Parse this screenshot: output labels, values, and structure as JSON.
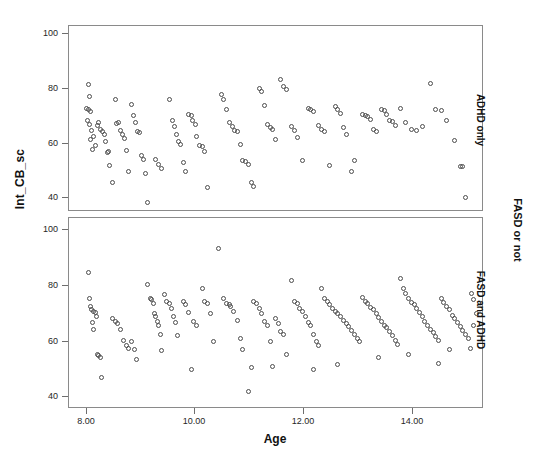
{
  "chart_data": {
    "type": "scatter",
    "title": "",
    "xlabel": "Age",
    "ylabel": "Int_CB_sc",
    "group_label": "FASD or not",
    "xlim": [
      7.6,
      15.2
    ],
    "ylim": [
      30,
      104
    ],
    "xticks": [
      8.0,
      10.0,
      12.0,
      14.0
    ],
    "xticklabels": [
      "8.00",
      "10.00",
      "12.00",
      "14.00"
    ],
    "yticks": [
      40,
      60,
      80,
      100
    ],
    "yticklabels": [
      "40",
      "60",
      "80",
      "100"
    ],
    "grid": false,
    "legend": "none",
    "marker": "open-circle",
    "marker_color": "#4c4c4c",
    "panels": [
      {
        "label": "ADHD only",
        "n": 124,
        "points": [
          [
            7.95,
            80.5
          ],
          [
            7.98,
            75.5
          ],
          [
            7.93,
            71.0
          ],
          [
            7.96,
            70.3
          ],
          [
            7.99,
            69.6
          ],
          [
            7.94,
            66.0
          ],
          [
            7.97,
            64.5
          ],
          [
            8.02,
            62.0
          ],
          [
            8.05,
            59.5
          ],
          [
            8.0,
            58.2
          ],
          [
            8.03,
            54.5
          ],
          [
            8.08,
            56.0
          ],
          [
            8.12,
            63.8
          ],
          [
            8.15,
            65.0
          ],
          [
            8.18,
            62.5
          ],
          [
            8.21,
            61.5
          ],
          [
            8.25,
            60.2
          ],
          [
            8.28,
            57.5
          ],
          [
            8.32,
            53.5
          ],
          [
            8.3,
            53.0
          ],
          [
            8.35,
            48.0
          ],
          [
            8.4,
            41.0
          ],
          [
            8.45,
            74.5
          ],
          [
            8.48,
            64.8
          ],
          [
            8.52,
            65.0
          ],
          [
            8.55,
            62.0
          ],
          [
            8.58,
            60.5
          ],
          [
            8.62,
            58.8
          ],
          [
            8.66,
            54.0
          ],
          [
            8.7,
            45.5
          ],
          [
            8.75,
            72.5
          ],
          [
            8.78,
            68.0
          ],
          [
            8.82,
            65.0
          ],
          [
            8.86,
            61.5
          ],
          [
            8.9,
            61.0
          ],
          [
            8.94,
            52.0
          ],
          [
            8.97,
            50.5
          ],
          [
            9.0,
            44.5
          ],
          [
            9.05,
            33.0
          ],
          [
            9.2,
            50.5
          ],
          [
            9.25,
            48.5
          ],
          [
            9.3,
            46.5
          ],
          [
            9.45,
            74.5
          ],
          [
            9.5,
            66.0
          ],
          [
            9.55,
            63.5
          ],
          [
            9.58,
            60.5
          ],
          [
            9.62,
            57.5
          ],
          [
            9.66,
            56.5
          ],
          [
            9.7,
            49.0
          ],
          [
            9.74,
            45.5
          ],
          [
            9.8,
            68.5
          ],
          [
            9.85,
            68.0
          ],
          [
            9.88,
            66.0
          ],
          [
            9.92,
            64.5
          ],
          [
            9.95,
            59.5
          ],
          [
            10.0,
            56.0
          ],
          [
            10.05,
            55.5
          ],
          [
            10.1,
            53.5
          ],
          [
            10.15,
            39.0
          ],
          [
            10.4,
            76.5
          ],
          [
            10.45,
            74.5
          ],
          [
            10.5,
            70.5
          ],
          [
            10.55,
            65.0
          ],
          [
            10.6,
            63.5
          ],
          [
            10.65,
            62.0
          ],
          [
            10.7,
            61.5
          ],
          [
            10.75,
            56.5
          ],
          [
            10.8,
            50.0
          ],
          [
            10.85,
            49.5
          ],
          [
            10.9,
            48.5
          ],
          [
            10.95,
            41.0
          ],
          [
            11.0,
            39.5
          ],
          [
            11.1,
            79.0
          ],
          [
            11.15,
            77.5
          ],
          [
            11.2,
            72.0
          ],
          [
            11.25,
            64.5
          ],
          [
            11.3,
            63.0
          ],
          [
            11.35,
            62.5
          ],
          [
            11.4,
            58.5
          ],
          [
            11.5,
            82.5
          ],
          [
            11.55,
            79.5
          ],
          [
            11.6,
            78.5
          ],
          [
            11.7,
            63.5
          ],
          [
            11.75,
            62.0
          ],
          [
            11.8,
            59.0
          ],
          [
            11.9,
            50.0
          ],
          [
            12.0,
            71.0
          ],
          [
            12.05,
            70.5
          ],
          [
            12.1,
            69.5
          ],
          [
            12.2,
            64.0
          ],
          [
            12.25,
            62.5
          ],
          [
            12.3,
            61.5
          ],
          [
            12.4,
            48.0
          ],
          [
            12.5,
            71.5
          ],
          [
            12.55,
            70.5
          ],
          [
            12.6,
            69.0
          ],
          [
            12.65,
            63.0
          ],
          [
            12.7,
            60.5
          ],
          [
            12.8,
            45.5
          ],
          [
            12.85,
            50.0
          ],
          [
            13.0,
            68.5
          ],
          [
            13.05,
            68.0
          ],
          [
            13.1,
            67.5
          ],
          [
            13.15,
            66.5
          ],
          [
            13.2,
            62.5
          ],
          [
            13.25,
            61.5
          ],
          [
            13.35,
            70.5
          ],
          [
            13.4,
            70.0
          ],
          [
            13.45,
            68.5
          ],
          [
            13.5,
            66.0
          ],
          [
            13.55,
            65.5
          ],
          [
            13.6,
            64.0
          ],
          [
            13.7,
            71.0
          ],
          [
            13.8,
            65.0
          ],
          [
            13.9,
            62.5
          ],
          [
            14.0,
            62.0
          ],
          [
            14.1,
            63.5
          ],
          [
            14.25,
            81.0
          ],
          [
            14.35,
            70.5
          ],
          [
            14.45,
            70.0
          ],
          [
            14.55,
            66.0
          ],
          [
            14.7,
            58.0
          ],
          [
            14.8,
            47.5
          ],
          [
            14.85,
            47.3
          ],
          [
            14.9,
            35.0
          ]
        ]
      },
      {
        "label": "FASD and ADHD",
        "n": 150,
        "points": [
          [
            7.95,
            82.5
          ],
          [
            7.98,
            72.5
          ],
          [
            8.0,
            69.5
          ],
          [
            8.02,
            68.0
          ],
          [
            8.05,
            67.5
          ],
          [
            8.08,
            67.0
          ],
          [
            8.1,
            65.5
          ],
          [
            8.04,
            63.0
          ],
          [
            8.06,
            60.5
          ],
          [
            8.12,
            50.5
          ],
          [
            8.15,
            50.0
          ],
          [
            8.18,
            49.5
          ],
          [
            8.2,
            41.5
          ],
          [
            8.4,
            64.5
          ],
          [
            8.45,
            63.5
          ],
          [
            8.5,
            62.5
          ],
          [
            8.55,
            60.5
          ],
          [
            8.6,
            56.0
          ],
          [
            8.65,
            54.0
          ],
          [
            8.7,
            53.0
          ],
          [
            8.75,
            55.5
          ],
          [
            8.8,
            52.5
          ],
          [
            9.05,
            78.0
          ],
          [
            9.1,
            72.5
          ],
          [
            9.12,
            72.0
          ],
          [
            9.15,
            70.5
          ],
          [
            9.18,
            66.5
          ],
          [
            9.2,
            65.5
          ],
          [
            9.22,
            63.5
          ],
          [
            9.25,
            62.0
          ],
          [
            9.28,
            58.5
          ],
          [
            9.35,
            74.0
          ],
          [
            9.4,
            71.5
          ],
          [
            9.45,
            70.5
          ],
          [
            9.48,
            68.5
          ],
          [
            9.52,
            65.5
          ],
          [
            9.56,
            63.0
          ],
          [
            9.6,
            58.0
          ],
          [
            9.7,
            71.5
          ],
          [
            9.75,
            70.0
          ],
          [
            9.8,
            67.0
          ],
          [
            9.9,
            63.5
          ],
          [
            9.95,
            62.0
          ],
          [
            10.05,
            76.5
          ],
          [
            10.1,
            71.5
          ],
          [
            10.15,
            70.5
          ],
          [
            10.2,
            66.5
          ],
          [
            10.25,
            55.5
          ],
          [
            10.35,
            92.0
          ],
          [
            10.45,
            72.5
          ],
          [
            10.5,
            70.5
          ],
          [
            10.55,
            70.0
          ],
          [
            10.58,
            69.5
          ],
          [
            10.62,
            67.5
          ],
          [
            10.7,
            64.0
          ],
          [
            10.75,
            57.0
          ],
          [
            10.8,
            52.5
          ],
          [
            10.9,
            36.0
          ],
          [
            11.0,
            71.5
          ],
          [
            11.05,
            70.5
          ],
          [
            11.1,
            68.5
          ],
          [
            11.15,
            66.5
          ],
          [
            11.2,
            63.5
          ],
          [
            11.25,
            62.0
          ],
          [
            11.3,
            55.5
          ],
          [
            11.4,
            64.5
          ],
          [
            11.45,
            62.5
          ],
          [
            11.5,
            59.5
          ],
          [
            11.55,
            58.5
          ],
          [
            11.6,
            50.5
          ],
          [
            11.7,
            79.5
          ],
          [
            11.75,
            71.5
          ],
          [
            11.8,
            70.5
          ],
          [
            11.85,
            68.5
          ],
          [
            11.9,
            67.5
          ],
          [
            11.95,
            65.5
          ],
          [
            12.0,
            63.0
          ],
          [
            12.05,
            62.0
          ],
          [
            12.1,
            58.5
          ],
          [
            12.15,
            55.5
          ],
          [
            12.2,
            54.0
          ],
          [
            12.25,
            76.5
          ],
          [
            12.3,
            72.5
          ],
          [
            12.35,
            71.5
          ],
          [
            12.4,
            70.0
          ],
          [
            12.45,
            68.5
          ],
          [
            12.5,
            67.5
          ],
          [
            12.55,
            66.5
          ],
          [
            12.6,
            65.5
          ],
          [
            12.65,
            64.0
          ],
          [
            12.7,
            62.5
          ],
          [
            12.75,
            61.5
          ],
          [
            12.8,
            60.0
          ],
          [
            12.85,
            58.5
          ],
          [
            12.9,
            57.0
          ],
          [
            12.95,
            55.5
          ],
          [
            13.0,
            73.0
          ],
          [
            13.05,
            71.5
          ],
          [
            13.1,
            70.5
          ],
          [
            13.15,
            69.0
          ],
          [
            13.2,
            68.0
          ],
          [
            13.25,
            66.5
          ],
          [
            13.3,
            65.0
          ],
          [
            13.35,
            63.5
          ],
          [
            13.4,
            62.0
          ],
          [
            13.45,
            61.0
          ],
          [
            13.5,
            59.5
          ],
          [
            13.55,
            58.0
          ],
          [
            13.6,
            56.0
          ],
          [
            13.65,
            54.5
          ],
          [
            13.7,
            80.5
          ],
          [
            13.75,
            76.5
          ],
          [
            13.8,
            74.5
          ],
          [
            13.85,
            72.5
          ],
          [
            13.9,
            71.0
          ],
          [
            13.95,
            70.0
          ],
          [
            14.0,
            68.5
          ],
          [
            14.05,
            67.0
          ],
          [
            14.1,
            65.5
          ],
          [
            14.15,
            63.5
          ],
          [
            14.2,
            62.0
          ],
          [
            14.25,
            60.5
          ],
          [
            14.3,
            59.0
          ],
          [
            14.35,
            57.5
          ],
          [
            14.4,
            56.0
          ],
          [
            14.45,
            72.5
          ],
          [
            14.5,
            71.0
          ],
          [
            14.55,
            69.5
          ],
          [
            14.6,
            68.0
          ],
          [
            14.65,
            66.0
          ],
          [
            14.7,
            64.5
          ],
          [
            14.75,
            63.0
          ],
          [
            14.8,
            61.5
          ],
          [
            14.85,
            60.0
          ],
          [
            14.9,
            58.5
          ],
          [
            14.95,
            57.0
          ],
          [
            15.0,
            74.5
          ],
          [
            15.05,
            72.0
          ],
          [
            15.1,
            66.5
          ],
          [
            15.05,
            62.0
          ],
          [
            14.98,
            53.0
          ],
          [
            14.6,
            52.5
          ],
          [
            14.4,
            47.0
          ],
          [
            12.55,
            46.5
          ],
          [
            12.1,
            44.5
          ],
          [
            11.35,
            46.0
          ],
          [
            10.95,
            45.5
          ],
          [
            9.85,
            44.5
          ],
          [
            9.3,
            52.0
          ],
          [
            8.85,
            48.5
          ],
          [
            13.85,
            50.5
          ],
          [
            13.3,
            49.5
          ]
        ]
      }
    ]
  }
}
